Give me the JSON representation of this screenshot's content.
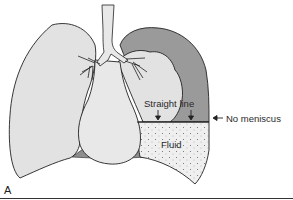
{
  "figure": {
    "panel_label": "A",
    "labels": {
      "straight_line": "Straight line",
      "no_meniscus": "No meniscus",
      "fluid": "Fluid"
    },
    "arrows": {
      "no_meniscus_arrow": "←"
    },
    "colors": {
      "lung_fill": "#e2e2e2",
      "heart_fill": "#e8e8e8",
      "air_space_fill": "#9a9a9a",
      "fluid_fill": "#efefef",
      "fluid_dots": "#6a6a6a",
      "outline": "#222222",
      "diaphragm_gap": "#8e8e8e"
    }
  }
}
